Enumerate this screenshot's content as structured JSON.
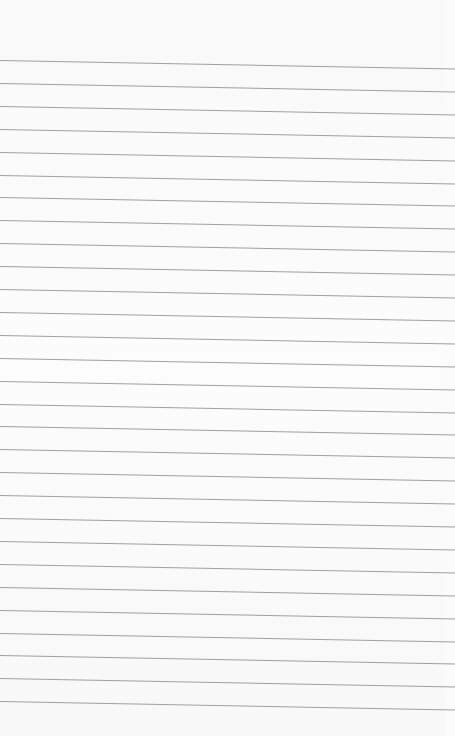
{
  "page": {
    "background_color": "#fbfbfb",
    "line_color": "#8f8f8f",
    "line_count": 29,
    "first_line_y": 60,
    "line_spacing": 22.9,
    "slope_deg": 1.05
  }
}
